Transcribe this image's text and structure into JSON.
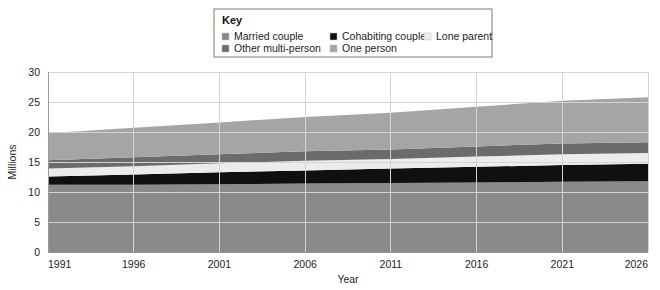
{
  "legend": {
    "title": "Key",
    "entries": [
      {
        "label": "Married couple",
        "color": "#8a8a8a",
        "swatch": "legend-swatch"
      },
      {
        "label": "Cohabiting couple",
        "color": "#101010",
        "swatch": "legend-swatch"
      },
      {
        "label": "Lone parent",
        "color": "#ececec",
        "swatch": "legend-swatch"
      },
      {
        "label": "Other multi-person",
        "color": "#6b6b6b",
        "swatch": "legend-swatch"
      },
      {
        "label": "One person",
        "color": "#a5a5a5",
        "swatch": "legend-swatch"
      }
    ]
  },
  "chart_data": {
    "type": "area",
    "title": "",
    "subtitle": "",
    "stacked": true,
    "xlabel": "Year",
    "ylabel": "Millions",
    "x": [
      1991,
      1996,
      2001,
      2006,
      2011,
      2016,
      2021,
      2026
    ],
    "xlim": [
      1991,
      2026
    ],
    "xticks": [
      1991,
      1996,
      2001,
      2006,
      2011,
      2016,
      2021,
      2026
    ],
    "xtick_labels": [
      "1991",
      "1996",
      "2001",
      "2006",
      "2011",
      "2016",
      "2021",
      "2026"
    ],
    "ylim": [
      0,
      30
    ],
    "yticks": [
      0,
      5,
      10,
      15,
      20,
      25,
      30
    ],
    "ytick_labels": [
      "0",
      "5",
      "10",
      "15",
      "20",
      "25",
      "30"
    ],
    "grid": true,
    "legend_position": "top-center",
    "series": [
      {
        "name": "Married couple",
        "color": "#8a8a8a",
        "values": [
          11.2,
          11.2,
          11.3,
          11.4,
          11.5,
          11.6,
          11.7,
          11.8
        ]
      },
      {
        "name": "Cohabiting couple",
        "color": "#101010",
        "values": [
          1.4,
          1.7,
          2.0,
          2.2,
          2.4,
          2.6,
          2.8,
          2.9
        ]
      },
      {
        "name": "Lone parent",
        "color": "#ececec",
        "values": [
          1.3,
          1.4,
          1.5,
          1.6,
          1.6,
          1.7,
          1.8,
          1.8
        ]
      },
      {
        "name": "Other multi-person",
        "color": "#6b6b6b",
        "values": [
          1.4,
          1.5,
          1.5,
          1.6,
          1.6,
          1.7,
          1.8,
          1.8
        ]
      },
      {
        "name": "One person",
        "color": "#a5a5a5",
        "values": [
          4.5,
          4.9,
          5.3,
          5.7,
          6.1,
          6.6,
          7.1,
          7.5
        ]
      }
    ],
    "totals": [
      19.8,
      20.7,
      21.6,
      22.5,
      23.2,
      24.2,
      25.2,
      25.8
    ]
  },
  "plot": {
    "left": 48,
    "right": 648,
    "top": 72,
    "bottom": 252
  }
}
